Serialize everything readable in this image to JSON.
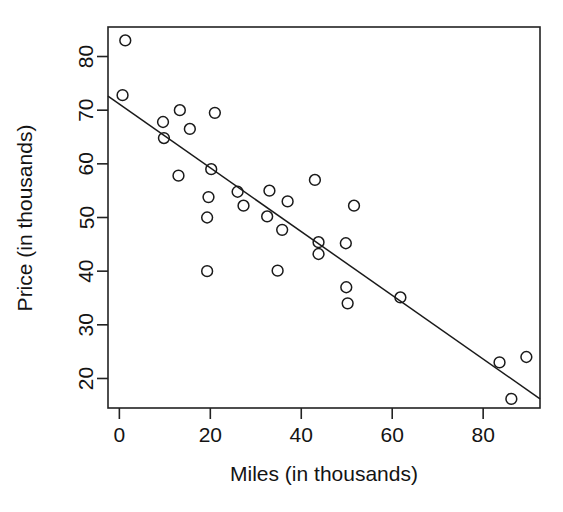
{
  "chart_data": {
    "type": "scatter",
    "title": "",
    "subtitle": "",
    "xlabel": "Miles (in thousands)",
    "ylabel": "Price (in thousands)",
    "xlim": [
      -2.5,
      92.5
    ],
    "ylim": [
      14.5,
      85.5
    ],
    "xticks": [
      0,
      20,
      40,
      60,
      80
    ],
    "xticklabels": [
      "0",
      "20",
      "40",
      "60",
      "80"
    ],
    "yticks": [
      20,
      30,
      40,
      50,
      60,
      70,
      80
    ],
    "yticklabels": [
      "20",
      "30",
      "40",
      "50",
      "60",
      "70",
      "80"
    ],
    "grid": false,
    "legend": null,
    "marker": "open-circle",
    "marker_color": "#1a1a1a",
    "marker_fill": "none",
    "points": [
      {
        "x": 1.3,
        "y": 83.0
      },
      {
        "x": 0.7,
        "y": 72.8
      },
      {
        "x": 9.6,
        "y": 67.8
      },
      {
        "x": 9.8,
        "y": 64.8
      },
      {
        "x": 13.3,
        "y": 70.0
      },
      {
        "x": 13.0,
        "y": 57.8
      },
      {
        "x": 15.5,
        "y": 66.5
      },
      {
        "x": 19.3,
        "y": 40.0
      },
      {
        "x": 19.3,
        "y": 50.0
      },
      {
        "x": 19.6,
        "y": 53.8
      },
      {
        "x": 20.2,
        "y": 59.0
      },
      {
        "x": 21.0,
        "y": 69.5
      },
      {
        "x": 26.0,
        "y": 54.8
      },
      {
        "x": 27.3,
        "y": 52.2
      },
      {
        "x": 32.5,
        "y": 50.2
      },
      {
        "x": 33.0,
        "y": 55.0
      },
      {
        "x": 34.8,
        "y": 40.1
      },
      {
        "x": 35.8,
        "y": 47.7
      },
      {
        "x": 37.0,
        "y": 53.0
      },
      {
        "x": 43.0,
        "y": 57.0
      },
      {
        "x": 43.8,
        "y": 45.4
      },
      {
        "x": 43.8,
        "y": 43.2
      },
      {
        "x": 49.8,
        "y": 45.2
      },
      {
        "x": 49.9,
        "y": 37.0
      },
      {
        "x": 50.2,
        "y": 34.0
      },
      {
        "x": 51.6,
        "y": 52.2
      },
      {
        "x": 61.8,
        "y": 35.1
      },
      {
        "x": 83.6,
        "y": 23.0
      },
      {
        "x": 86.2,
        "y": 16.2
      },
      {
        "x": 89.5,
        "y": 24.0
      }
    ],
    "fit_line": {
      "type": "linear-regression",
      "x_start": -2.5,
      "y_start": 72.6,
      "x_end": 92.5,
      "y_end": 16.2
    }
  }
}
